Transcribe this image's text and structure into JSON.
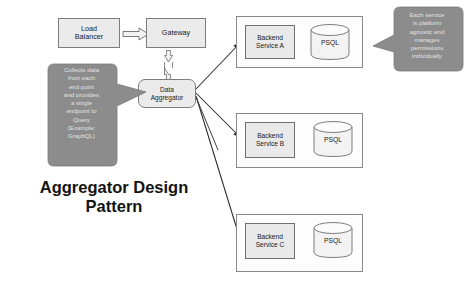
{
  "diagram": {
    "title": "Aggregator Design\nPattern",
    "nodes": {
      "load_balancer": "Load\nBalancer",
      "gateway": "Gateway",
      "data_aggregator": "Data\nAggregator"
    },
    "services": [
      {
        "name": "Backend\nService A",
        "db": "PSQL"
      },
      {
        "name": "Backend\nService B",
        "db": "PSQL"
      },
      {
        "name": "Backend\nService C",
        "db": "PSQL"
      }
    ],
    "callouts": {
      "left": "Collects data\nfrom each\nend point\nand provides\na single\nendpoint to\nQuery\n(Example:\nGraphQL)",
      "right": "Each service\nis platform\nagnostic and\nmanages\npermissions\nindividually"
    },
    "colors": {
      "callout_fill": "#8c8c8c",
      "callout_text": "#e2e2e2",
      "node_fill": "#ebebeb",
      "node_stroke": "#7d7d7d",
      "group_stroke": "#8a8a8a",
      "line": "#2b2b2b",
      "title_text": "#141414"
    }
  }
}
